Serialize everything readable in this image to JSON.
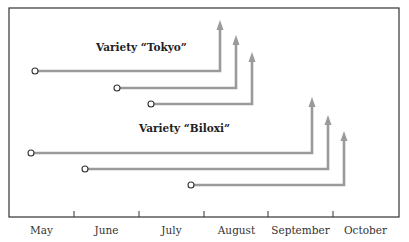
{
  "title": "",
  "groups": [
    {
      "label": "Variety “Tokyo”",
      "label_pos": {
        "x": 96,
        "y": 48
      },
      "bars": [
        {
          "start_x": 35,
          "end_x": 220,
          "y": 71,
          "arrow_top": 20
        },
        {
          "start_x": 117,
          "end_x": 236,
          "y": 88,
          "arrow_top": 35
        },
        {
          "start_x": 151,
          "end_x": 252,
          "y": 104,
          "arrow_top": 52
        }
      ]
    },
    {
      "label": "Variety “Biloxi”",
      "label_pos": {
        "x": 139,
        "y": 129
      },
      "bars": [
        {
          "start_x": 31,
          "end_x": 312,
          "y": 153,
          "arrow_top": 97
        },
        {
          "start_x": 85,
          "end_x": 328,
          "y": 169,
          "arrow_top": 115
        },
        {
          "start_x": 191,
          "end_x": 344,
          "y": 185,
          "arrow_top": 131
        }
      ]
    }
  ],
  "axis": {
    "months": [
      "May",
      "June",
      "July",
      "August",
      "September",
      "October"
    ],
    "tick_x": [
      74,
      139,
      204,
      268,
      333
    ]
  },
  "colors": {
    "line": "#9a9a9a",
    "frame": "#333333",
    "text": "#222222"
  }
}
